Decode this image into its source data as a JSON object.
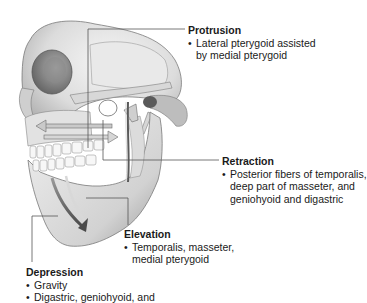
{
  "diagram": {
    "labels": {
      "protrusion": {
        "title": "Protrusion",
        "items": [
          {
            "line1": "Lateral pterygoid assisted",
            "line2": "by medial pterygoid"
          }
        ]
      },
      "retraction": {
        "title": "Retraction",
        "items": [
          {
            "line1": "Posterior fibers of temporalis,",
            "line2": "deep part of masseter, and",
            "line3": "geniohyoid and digastric"
          }
        ]
      },
      "elevation": {
        "title": "Elevation",
        "items": [
          {
            "line1": "Temporalis, masseter,",
            "line2": "medial pterygoid"
          }
        ]
      },
      "depression": {
        "title": "Depression",
        "items": [
          {
            "line1": "Gravity"
          },
          {
            "line1": "Digastric, geniohyoid, and"
          }
        ]
      }
    },
    "bullet": "•",
    "colors": {
      "leader_line": "#555555",
      "arrow_fill": "#c9c9c9",
      "arrow_stroke": "#6b6b6b",
      "bone_light": "#efefef",
      "bone_shadow": "#8a8a8a",
      "text": "#1a1a1a"
    }
  }
}
